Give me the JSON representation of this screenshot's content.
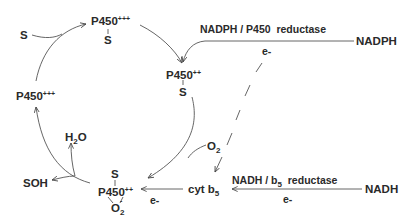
{
  "diagram": {
    "nodes": {
      "p450_top": {
        "label": "P450",
        "charge": "+++",
        "ligand": "S"
      },
      "p450_right": {
        "label": "P450",
        "charge": "++",
        "ligand": "S"
      },
      "p450_bottom": {
        "label": "P450",
        "charge": "++",
        "ligand_top": "S",
        "ligand_bottom": "O",
        "ligand_bottom_sub": "2",
        "ligand_bottom_sup": "-"
      },
      "p450_left": {
        "label": "P450",
        "charge": "+++"
      },
      "substrate": {
        "label": "S"
      },
      "water": {
        "label": "H",
        "sub": "2",
        "label2": "O"
      },
      "product": {
        "label": "SOH"
      },
      "oxygen": {
        "label": "O",
        "sub": "2"
      },
      "cyt_b5": {
        "label": "cyt b",
        "sub": "5"
      },
      "nadph": {
        "label": "NADPH"
      },
      "nadh": {
        "label": "NADH"
      }
    },
    "edges": {
      "nadph_reductase": {
        "label": "NADPH / P450  reductase",
        "electron": "e-"
      },
      "nadh_reductase": {
        "label_pre": "NADH / b",
        "label_sub": "5",
        "label_post": "  reductase",
        "electron": "e-"
      },
      "cyt_to_p450": {
        "electron": "e-"
      }
    }
  }
}
